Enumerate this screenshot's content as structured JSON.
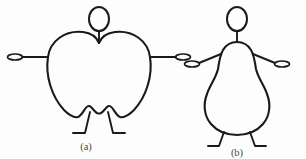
{
  "figure": {
    "background_color": "#fdfdfd",
    "stroke_color": "#1a1a1a",
    "caption_color": "#4a4a4a",
    "panels": [
      {
        "id": "panel-a",
        "label": "(a)",
        "body_shape": "apple",
        "description": "Apple-shaped body type stick figure",
        "label_x": 86,
        "label_y": 150,
        "head": {
          "cx": 99,
          "cy": 19,
          "rx": 10,
          "ry": 12
        },
        "neck": {
          "x1": 99,
          "y1": 31,
          "x2": 99,
          "y2": 43
        },
        "torso_path": "M 99 43 C 97 38 92 33 83 32 C 65 30 50 41 48 57 C 45 76 52 97 64 110 C 70 116 74 118 78 117 C 81 116 83 112 85 109 C 87 106 89 105 91 107 C 93 109 95 112 97 113 C 99 114 99 114 101 113 C 103 112 105 109 107 107 C 109 105 111 106 113 109 C 115 112 117 116 120 117 C 124 118 128 116 134 110 C 146 97 153 76 150 57 C 148 41 133 30 115 32 C 106 33 101 38 99 43 Z",
        "arms": [
          {
            "name": "left-arm",
            "x1": 48,
            "y1": 57,
            "x2": 22,
            "y2": 57
          },
          {
            "name": "right-arm",
            "x1": 150,
            "y1": 57,
            "x2": 176,
            "y2": 57
          }
        ],
        "hands": [
          {
            "name": "left-hand",
            "cx": 15,
            "cy": 57,
            "rx": 7.5,
            "ry": 3.0
          },
          {
            "name": "right-hand",
            "cx": 183,
            "cy": 57,
            "rx": 7.5,
            "ry": 3.0
          }
        ],
        "legs": [
          {
            "name": "left-leg",
            "path": "M 89 111 L 85 133 L 73 133"
          },
          {
            "name": "right-leg",
            "path": "M 109 111 L 112 133 L 124 133"
          }
        ]
      },
      {
        "id": "panel-b",
        "label": "(b)",
        "body_shape": "pear",
        "description": "Pear-shaped body type stick figure",
        "label_x": 237,
        "label_y": 150,
        "head": {
          "cx": 237,
          "cy": 19,
          "rx": 10,
          "ry": 12
        },
        "neck": {
          "x1": 237,
          "y1": 31,
          "x2": 237,
          "y2": 42
        },
        "torso_path": "M 237 42 C 231 42 226 45 223 50 C 220 55 219 62 218 69 C 216 78 210 85 207 94 C 203 104 204 116 211 124 C 218 132 228 135 237 135 C 246 135 256 132 263 124 C 270 116 271 104 267 94 C 264 85 258 78 256 69 C 255 62 254 55 251 50 C 248 45 243 42 237 42 Z",
        "arms": [
          {
            "name": "left-arm",
            "x1": 221,
            "y1": 54,
            "x2": 199,
            "y2": 63
          },
          {
            "name": "right-arm",
            "x1": 253,
            "y1": 54,
            "x2": 275,
            "y2": 63
          }
        ],
        "hands": [
          {
            "name": "left-hand",
            "cx": 192,
            "cy": 64,
            "rx": 7.5,
            "ry": 3.0
          },
          {
            "name": "right-hand",
            "cx": 282,
            "cy": 64,
            "rx": 7.5,
            "ry": 3.0
          }
        ],
        "legs": [
          {
            "name": "left-leg",
            "path": "M 226 134 L 221 133 L 218 133 L 214 133"
          },
          {
            "name": "right-leg",
            "path": "M 248 134 L 253 133 L 256 133 L 260 133"
          }
        ],
        "legs_drawn": [
          {
            "name": "left-leg",
            "path": "M 224 133 L 218 124 M 218 124 L 218 124"
          },
          {
            "name": "right-leg",
            "path": "M 250 133 L 256 124"
          }
        ]
      }
    ]
  }
}
